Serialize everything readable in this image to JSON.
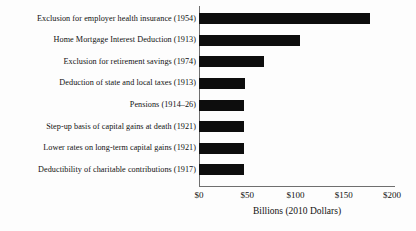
{
  "chart_data": {
    "type": "bar",
    "orientation": "horizontal",
    "title": "",
    "xlabel": "Billions (2010 Dollars)",
    "ylabel": "",
    "xlim": [
      0,
      200
    ],
    "xticks": [
      "$0",
      "$50",
      "$100",
      "$150",
      "$200"
    ],
    "xtick_values": [
      0,
      50,
      100,
      150,
      200
    ],
    "grid": false,
    "legend": null,
    "categories": [
      "Exclusion for employer health insurance  (1954)",
      "Home Mortgage Interest Deduction (1913)",
      "Exclusion for retirement savings (1974)",
      "Deduction of state and local taxes (1913)",
      "Pensions (1914–26)",
      "Step-up basis of capital gains at death (1921)",
      "Lower rates on long-term capital gains (1921)",
      "Deductibility of charitable contributions  (1917)"
    ],
    "values": [
      177,
      105,
      67,
      48,
      47,
      47,
      47,
      47
    ],
    "bar_color": "#0d0d0d",
    "axis_color": "#6f6f6f",
    "background_color": "#fdfdfd"
  }
}
